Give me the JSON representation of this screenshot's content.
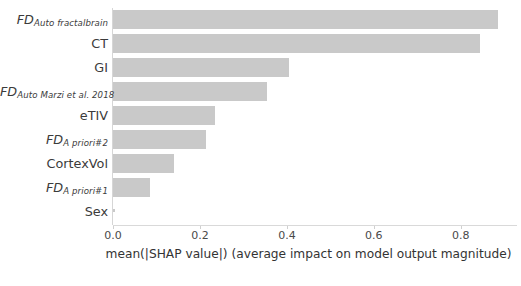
{
  "chart_data": {
    "type": "bar",
    "orientation": "horizontal",
    "title": "",
    "subtitle": "",
    "xlabel": "mean(|SHAP value|) (average impact on model output magnitude)",
    "ylabel": "",
    "xlim": [
      0.0,
      0.92
    ],
    "ylim": [
      0,
      9
    ],
    "grid": false,
    "legend": null,
    "bar_color": "#c9c9c9",
    "xticks": [
      "0.0",
      "0.2",
      "0.4",
      "0.6",
      "0.8"
    ],
    "xtick_values": [
      0.0,
      0.2,
      0.4,
      0.6,
      0.8
    ],
    "categories": [
      "FD Auto fractalbrain",
      "CT",
      "GI",
      "FD Auto Marzi et al. 2018",
      "eTIV",
      "FD A priori#2",
      "CortexVol",
      "FD A priori#1",
      "Sex"
    ],
    "values": [
      0.885,
      0.845,
      0.405,
      0.355,
      0.235,
      0.215,
      0.14,
      0.085,
      0.005
    ],
    "bars": [
      {
        "base": "FD",
        "sub": "Auto fractalbrain",
        "plain": "",
        "value": 0.885
      },
      {
        "base": "",
        "sub": "",
        "plain": "CT",
        "value": 0.845
      },
      {
        "base": "",
        "sub": "",
        "plain": "GI",
        "value": 0.405
      },
      {
        "base": "FD",
        "sub": "Auto Marzi et al. 2018",
        "plain": "",
        "value": 0.355
      },
      {
        "base": "",
        "sub": "",
        "plain": "eTIV",
        "value": 0.235
      },
      {
        "base": "FD",
        "sub": "A priori#2",
        "plain": "",
        "value": 0.215
      },
      {
        "base": "",
        "sub": "",
        "plain": "CortexVol",
        "value": 0.14
      },
      {
        "base": "FD",
        "sub": "A priori#1",
        "plain": "",
        "value": 0.085
      },
      {
        "base": "",
        "sub": "",
        "plain": "Sex",
        "value": 0.005
      }
    ]
  }
}
